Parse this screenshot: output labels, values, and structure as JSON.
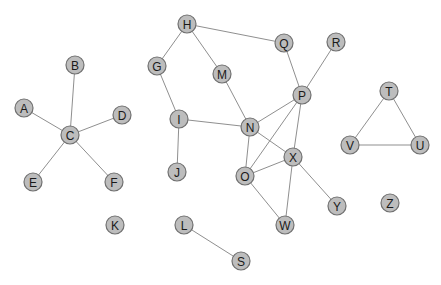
{
  "diagram": {
    "type": "undirected-graph",
    "node_radius": 9,
    "colors": {
      "node_fill": "#bdbdbd",
      "node_stroke": "#707070",
      "edge": "#8f8f8f",
      "label": "#1a1a1a",
      "background": "#ffffff"
    },
    "nodes": [
      {
        "id": "A",
        "x": 24,
        "y": 108
      },
      {
        "id": "B",
        "x": 75,
        "y": 65
      },
      {
        "id": "C",
        "x": 70,
        "y": 135
      },
      {
        "id": "D",
        "x": 122,
        "y": 115
      },
      {
        "id": "E",
        "x": 33,
        "y": 182
      },
      {
        "id": "F",
        "x": 114,
        "y": 182
      },
      {
        "id": "G",
        "x": 157,
        "y": 66
      },
      {
        "id": "H",
        "x": 187,
        "y": 24
      },
      {
        "id": "I",
        "x": 179,
        "y": 119
      },
      {
        "id": "J",
        "x": 177,
        "y": 172
      },
      {
        "id": "K",
        "x": 115,
        "y": 225
      },
      {
        "id": "L",
        "x": 184,
        "y": 225
      },
      {
        "id": "M",
        "x": 222,
        "y": 74
      },
      {
        "id": "N",
        "x": 250,
        "y": 127
      },
      {
        "id": "O",
        "x": 245,
        "y": 176
      },
      {
        "id": "P",
        "x": 302,
        "y": 95
      },
      {
        "id": "Q",
        "x": 284,
        "y": 43
      },
      {
        "id": "R",
        "x": 336,
        "y": 42
      },
      {
        "id": "S",
        "x": 241,
        "y": 261
      },
      {
        "id": "T",
        "x": 389,
        "y": 91
      },
      {
        "id": "U",
        "x": 420,
        "y": 145
      },
      {
        "id": "V",
        "x": 350,
        "y": 145
      },
      {
        "id": "W",
        "x": 285,
        "y": 225
      },
      {
        "id": "X",
        "x": 293,
        "y": 157
      },
      {
        "id": "Y",
        "x": 337,
        "y": 206
      },
      {
        "id": "Z",
        "x": 390,
        "y": 203
      }
    ],
    "edges": [
      [
        "C",
        "A"
      ],
      [
        "C",
        "B"
      ],
      [
        "C",
        "D"
      ],
      [
        "C",
        "E"
      ],
      [
        "C",
        "F"
      ],
      [
        "H",
        "G"
      ],
      [
        "H",
        "M"
      ],
      [
        "H",
        "Q"
      ],
      [
        "G",
        "I"
      ],
      [
        "I",
        "J"
      ],
      [
        "I",
        "N"
      ],
      [
        "M",
        "N"
      ],
      [
        "Q",
        "P"
      ],
      [
        "R",
        "P"
      ],
      [
        "N",
        "P"
      ],
      [
        "N",
        "O"
      ],
      [
        "N",
        "X"
      ],
      [
        "P",
        "O"
      ],
      [
        "P",
        "X"
      ],
      [
        "O",
        "X"
      ],
      [
        "O",
        "W"
      ],
      [
        "X",
        "W"
      ],
      [
        "X",
        "Y"
      ],
      [
        "L",
        "S"
      ],
      [
        "T",
        "V"
      ],
      [
        "T",
        "U"
      ],
      [
        "V",
        "U"
      ]
    ]
  }
}
